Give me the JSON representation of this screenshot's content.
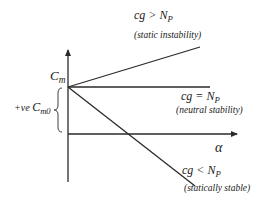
{
  "diagram": {
    "axes": {
      "y_label_main": "C",
      "y_label_sub": "m",
      "x_label": "α"
    },
    "intercept": {
      "prefix": "+ve ",
      "symbol": "C",
      "subscript": "m0"
    },
    "lines": [
      {
        "id": "unstable",
        "condition_prefix": "cg > N",
        "condition_sub": "P",
        "note": "(static instability)"
      },
      {
        "id": "neutral",
        "condition_prefix": "cg = N",
        "condition_sub": "P",
        "note": "(neutral stability)"
      },
      {
        "id": "stable",
        "condition_prefix": "cg < N",
        "condition_sub": "P",
        "note": "(statically stable)"
      }
    ],
    "colors": {
      "line": "#2a2a2a",
      "text": "#222222",
      "background": "#ffffff"
    }
  }
}
